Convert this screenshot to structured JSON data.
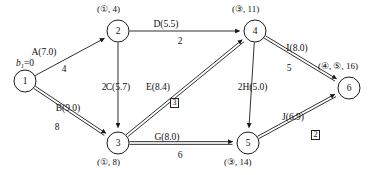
{
  "diagram": {
    "source_label": "b1=0",
    "source_label_var": "b",
    "source_label_sub": "1",
    "source_label_rest": "=0"
  },
  "style": {
    "stroke": "#1a1a1a",
    "background": "#ffffff",
    "node_fill": "#ffffff"
  },
  "nodes": [
    {
      "id": "1",
      "label": "1",
      "cx": 25,
      "cy": 81,
      "r": 11,
      "tag": "",
      "tag_x": 0,
      "tag_y": 0
    },
    {
      "id": "2",
      "label": "2",
      "cx": 118,
      "cy": 31,
      "r": 11,
      "tag": "(①, 4)",
      "tag_x": 97,
      "tag_y": 5
    },
    {
      "id": "3",
      "label": "3",
      "cx": 118,
      "cy": 143,
      "r": 11,
      "tag": "(①, 8)",
      "tag_x": 97,
      "tag_y": 158
    },
    {
      "id": "4",
      "label": "4",
      "cx": 255,
      "cy": 31,
      "r": 11,
      "tag": "(③, 11)",
      "tag_x": 232,
      "tag_y": 5
    },
    {
      "id": "5",
      "label": "5",
      "cx": 248,
      "cy": 143,
      "r": 11,
      "tag": "(③, 14)",
      "tag_x": 224,
      "tag_y": 158
    },
    {
      "id": "6",
      "label": "6",
      "cx": 349,
      "cy": 88,
      "r": 11,
      "tag": "(④, ⑤, 16)",
      "tag_x": 318,
      "tag_y": 62
    }
  ],
  "edges": [
    {
      "id": "A",
      "from": "1",
      "to": "2",
      "name": "A(7.0)",
      "weight": "4",
      "critical": false,
      "name_x": 44,
      "name_y": 48,
      "weight_x": 64,
      "weight_y": 65,
      "box": "",
      "box_x": 0,
      "box_y": 0
    },
    {
      "id": "B",
      "from": "1",
      "to": "3",
      "name": "B(9.0)",
      "weight": "8",
      "critical": true,
      "name_x": 68,
      "name_y": 104,
      "weight_x": 57,
      "weight_y": 123,
      "box": "",
      "box_x": 0,
      "box_y": 0
    },
    {
      "id": "C",
      "from": "2",
      "to": "3",
      "name": "C(5.7)",
      "weight": "2",
      "critical": false,
      "name_x": 118,
      "name_y": 83,
      "weight_x": 104,
      "weight_y": 83,
      "box": "",
      "box_x": 0,
      "box_y": 0
    },
    {
      "id": "D",
      "from": "2",
      "to": "4",
      "name": "D(5.5)",
      "weight": "2",
      "critical": false,
      "name_x": 166,
      "name_y": 20,
      "weight_x": 180,
      "weight_y": 37,
      "box": "",
      "box_x": 0,
      "box_y": 0
    },
    {
      "id": "E",
      "from": "3",
      "to": "4",
      "name": "E(8.4)",
      "weight": "",
      "critical": true,
      "name_x": 158,
      "name_y": 83,
      "weight_x": 0,
      "weight_y": 0,
      "box": "3",
      "box_x": 170,
      "box_y": 98
    },
    {
      "id": "G",
      "from": "3",
      "to": "5",
      "name": "G(8.0)",
      "weight": "6",
      "critical": true,
      "name_x": 167,
      "name_y": 133,
      "weight_x": 180,
      "weight_y": 151,
      "box": "",
      "box_x": 0,
      "box_y": 0
    },
    {
      "id": "H",
      "from": "4",
      "to": "5",
      "name": "H(5.0)",
      "weight": "2",
      "critical": false,
      "name_x": 255,
      "name_y": 83,
      "weight_x": 240,
      "weight_y": 83,
      "box": "",
      "box_x": 0,
      "box_y": 0
    },
    {
      "id": "I",
      "from": "4",
      "to": "6",
      "name": "I(8.0)",
      "weight": "5",
      "critical": true,
      "name_x": 297,
      "name_y": 44,
      "weight_x": 289,
      "weight_y": 64,
      "box": "",
      "box_x": 0,
      "box_y": 0
    },
    {
      "id": "J",
      "from": "5",
      "to": "6",
      "name": "J(6.9)",
      "weight": "",
      "critical": true,
      "name_x": 293,
      "name_y": 113,
      "weight_x": 0,
      "weight_y": 0,
      "box": "2",
      "box_x": 311,
      "box_y": 130
    }
  ]
}
